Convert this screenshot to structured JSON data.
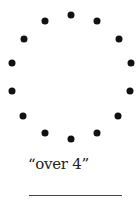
{
  "figure": {
    "dots": [
      {
        "x": 70.7,
        "y": 15
      },
      {
        "x": 97.3,
        "y": 21
      },
      {
        "x": 118.7,
        "y": 39
      },
      {
        "x": 131,
        "y": 63
      },
      {
        "x": 130,
        "y": 91.3
      },
      {
        "x": 118,
        "y": 116
      },
      {
        "x": 97.3,
        "y": 132.7
      },
      {
        "x": 70.7,
        "y": 139
      },
      {
        "x": 45,
        "y": 133.3
      },
      {
        "x": 23.3,
        "y": 116
      },
      {
        "x": 12.3,
        "y": 91.3
      },
      {
        "x": 12.3,
        "y": 63
      },
      {
        "x": 24,
        "y": 39
      },
      {
        "x": 45,
        "y": 21
      }
    ],
    "dot_count": 14,
    "dot_color": "#111111"
  },
  "caption": {
    "text": "“over 4”"
  },
  "answer_blank": {
    "value": ""
  }
}
